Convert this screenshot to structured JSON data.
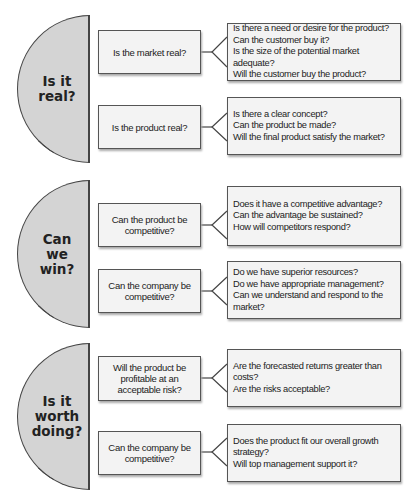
{
  "sections": [
    {
      "title": "Is it\nreal?",
      "questions": [
        {
          "label": "Is the market real?",
          "details": [
            "Is there a need or desire for the product?",
            "Can the customer buy it?",
            "Is the size of the potential market adequate?",
            "Will the customer buy the product?"
          ]
        },
        {
          "label": "Is the product real?",
          "details": [
            "Is there a clear concept?",
            "Can the product be made?",
            "Will the final product satisfy the market?"
          ]
        }
      ]
    },
    {
      "title": "Can\nwe\nwin?",
      "questions": [
        {
          "label": "Can the product be\ncompetitive?",
          "details": [
            "Does it have a competitive advantage?",
            "Can the advantage be sustained?",
            "How will competitors respond?"
          ]
        },
        {
          "label": "Can the company be\ncompetitive?",
          "details": [
            "Do we have superior resources?",
            "Do we have appropriate management?",
            "Can we understand and respond to the market?"
          ]
        }
      ]
    },
    {
      "title": "Is it\nworth\ndoing?",
      "questions": [
        {
          "label": "Will the product be\nprofitable at an\nacceptable risk?",
          "details": [
            "Are the forecasted returns greater than costs?",
            "Are the risks acceptable?"
          ]
        },
        {
          "label": "Can the company be\ncompetitive?",
          "details": [
            "Does the product fit our overall growth",
            "strategy?",
            "Will top management support it?"
          ]
        }
      ]
    }
  ]
}
